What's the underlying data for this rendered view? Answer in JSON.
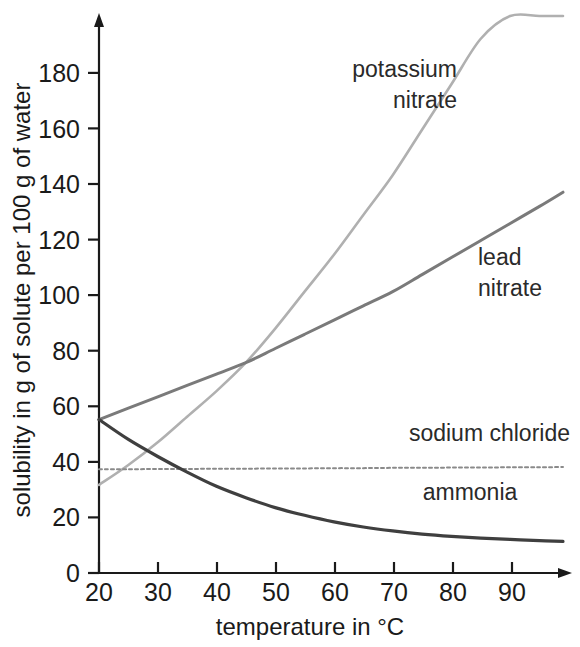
{
  "chart_data": {
    "type": "line",
    "title": "",
    "xlabel": "temperature in °C",
    "ylabel": "solubility in g of solute per 100 g of water",
    "xlim": [
      20,
      99
    ],
    "ylim": [
      0,
      196
    ],
    "xticks": [
      20,
      30,
      40,
      50,
      60,
      70,
      80,
      90
    ],
    "yticks": [
      0,
      20,
      40,
      60,
      80,
      100,
      120,
      140,
      160,
      180
    ],
    "grid": false,
    "legend": "inline labels next to each curve",
    "x": [
      20,
      25,
      30,
      35,
      40,
      45,
      50,
      55,
      60,
      65,
      70,
      75,
      80,
      85,
      90,
      95,
      99
    ],
    "series": [
      {
        "name": "potassium nitrate",
        "color": "#b0b0b0",
        "style": "solid",
        "label_x": 58,
        "label_y": 186,
        "values": [
          31,
          38,
          46,
          55,
          64,
          74,
          86,
          99,
          112,
          126,
          140,
          156,
          172,
          188,
          196,
          196,
          196
        ]
      },
      {
        "name": "lead nitrate",
        "color": "#7a7a7a",
        "style": "solid",
        "label_x": 87,
        "label_y": 112,
        "values": [
          54,
          58,
          62,
          66,
          70,
          74,
          79,
          84,
          89,
          94,
          99,
          105,
          111,
          117,
          123,
          129,
          134
        ]
      },
      {
        "name": "sodium chloride",
        "color": "#8a8a8a",
        "style": "dotted",
        "label_x": 82,
        "label_y": 43,
        "values": [
          36.5,
          36.5,
          36.6,
          36.6,
          36.7,
          36.7,
          36.8,
          36.8,
          36.9,
          36.9,
          37,
          37,
          37.1,
          37.1,
          37.2,
          37.2,
          37.3
        ]
      },
      {
        "name": "ammonia",
        "color": "#3f3f3f",
        "style": "solid",
        "label_x": 73,
        "label_y": 27,
        "values": [
          54,
          47,
          41,
          35.5,
          30.5,
          26.5,
          23,
          20.3,
          18,
          16.2,
          14.8,
          13.7,
          12.9,
          12.3,
          11.8,
          11.4,
          11.1
        ]
      }
    ]
  },
  "labels": {
    "potassium_nitrate_line1": "potassium",
    "potassium_nitrate_line2": "nitrate",
    "lead_nitrate_line1": "lead",
    "lead_nitrate_line2": "nitrate",
    "sodium_chloride": "sodium chloride",
    "ammonia": "ammonia",
    "x_axis_title": "temperature in °C",
    "y_axis_title": "solubility in g of solute per 100 g of water"
  },
  "xticks": {
    "t0": "20",
    "t1": "30",
    "t2": "40",
    "t3": "50",
    "t4": "60",
    "t5": "70",
    "t6": "80",
    "t7": "90"
  },
  "yticks": {
    "t0": "0",
    "t1": "20",
    "t2": "40",
    "t3": "60",
    "t4": "80",
    "t5": "100",
    "t6": "120",
    "t7": "140",
    "t8": "160",
    "t9": "180"
  }
}
